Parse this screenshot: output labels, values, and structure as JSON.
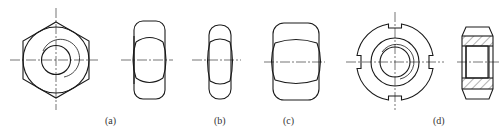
{
  "figure": {
    "labels": {
      "a": "(a)",
      "b": "(b)",
      "c": "(c)",
      "d": "(d)"
    },
    "views": [
      {
        "id": "a",
        "name": "hex nut top view"
      },
      {
        "id": "a-side",
        "name": "hex nut side view"
      },
      {
        "id": "b",
        "name": "thin hex nut side view"
      },
      {
        "id": "c",
        "name": "thick hex nut side view"
      },
      {
        "id": "d",
        "name": "slotted round nut top view"
      },
      {
        "id": "d-section",
        "name": "slotted round nut section view"
      }
    ],
    "colors": {
      "line": "#1a1a1a",
      "background": "#ffffff"
    }
  }
}
